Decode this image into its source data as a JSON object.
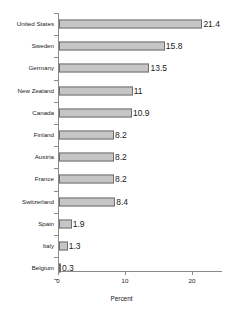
{
  "chart_data": {
    "type": "bar",
    "orientation": "horizontal",
    "title": "",
    "xlabel": "Percent",
    "ylabel": "",
    "xlim": [
      0,
      24.5
    ],
    "xticks": [
      0,
      10,
      20
    ],
    "xtick_labels": [
      "0",
      "10",
      "20"
    ],
    "grid": false,
    "legend": null,
    "bar_color": "#c6c6c6",
    "bar_edge_color": "#6e6e6e",
    "axis_color": "#8a8a8a",
    "background_color": "#ffffff",
    "categories": [
      "United States",
      "Sweden",
      "Germany",
      "New Zealand",
      "Canada",
      "Finland",
      "Austria",
      "France",
      "Switzerland",
      "Spain",
      "Italy",
      "Belgium"
    ],
    "values": [
      21.4,
      15.8,
      13.5,
      11,
      10.9,
      8.2,
      8.2,
      8.2,
      8.4,
      1.9,
      1.3,
      0.3
    ],
    "value_labels": [
      "21.4",
      "15.8",
      "13.5",
      "11",
      "10.9",
      "8.2",
      "8.2",
      "8.2",
      "8.4",
      "1.9",
      "1.3",
      "0.3"
    ]
  }
}
